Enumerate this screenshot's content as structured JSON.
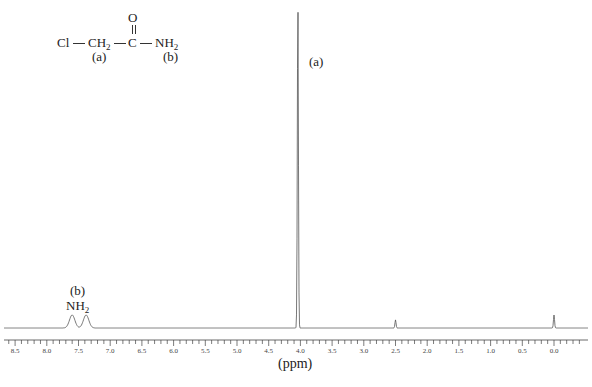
{
  "chart_data": {
    "type": "line",
    "title": "",
    "subtitle": "1H NMR spectrum of chloroacetamide",
    "xlabel": "(ppm)",
    "ylabel": "",
    "xlim": [
      8.65,
      -0.5
    ],
    "x_reversed": true,
    "grid": false,
    "ticks": [
      "8.5",
      "8.0",
      "7.5",
      "7.0",
      "6.5",
      "6.0",
      "5.5",
      "5.0",
      "4.5",
      "4.0",
      "3.5",
      "3.0",
      "2.5",
      "2.0",
      "1.5",
      "1.0",
      "0.5",
      "0.0"
    ],
    "peaks": [
      {
        "ppm": 7.6,
        "relative_height": 0.04,
        "label": "NH2 (b)"
      },
      {
        "ppm": 7.38,
        "relative_height": 0.04,
        "label": "NH2 (b)"
      },
      {
        "ppm": 4.04,
        "relative_height": 1.0,
        "label": "(a)"
      },
      {
        "ppm": 2.5,
        "relative_height": 0.025,
        "label": ""
      },
      {
        "ppm": 0.0,
        "relative_height": 0.04,
        "label": ""
      }
    ],
    "annotations": [
      {
        "text": "(a)",
        "near_ppm": 4.04
      },
      {
        "text": "(b) NH2",
        "near_ppm": 7.5
      }
    ]
  },
  "structure": {
    "carbonyl_o": "O",
    "cl": "Cl",
    "ch2": "CH",
    "ch2_sub": "2",
    "c": "C",
    "nh2": "NH",
    "nh2_sub": "2",
    "label_a": "(a)",
    "label_b": "(b)"
  },
  "labels": {
    "peak_a": "(a)",
    "peak_b": "(b)",
    "nh2": "NH",
    "nh2_sub": "2",
    "xaxis": "(ppm)"
  }
}
